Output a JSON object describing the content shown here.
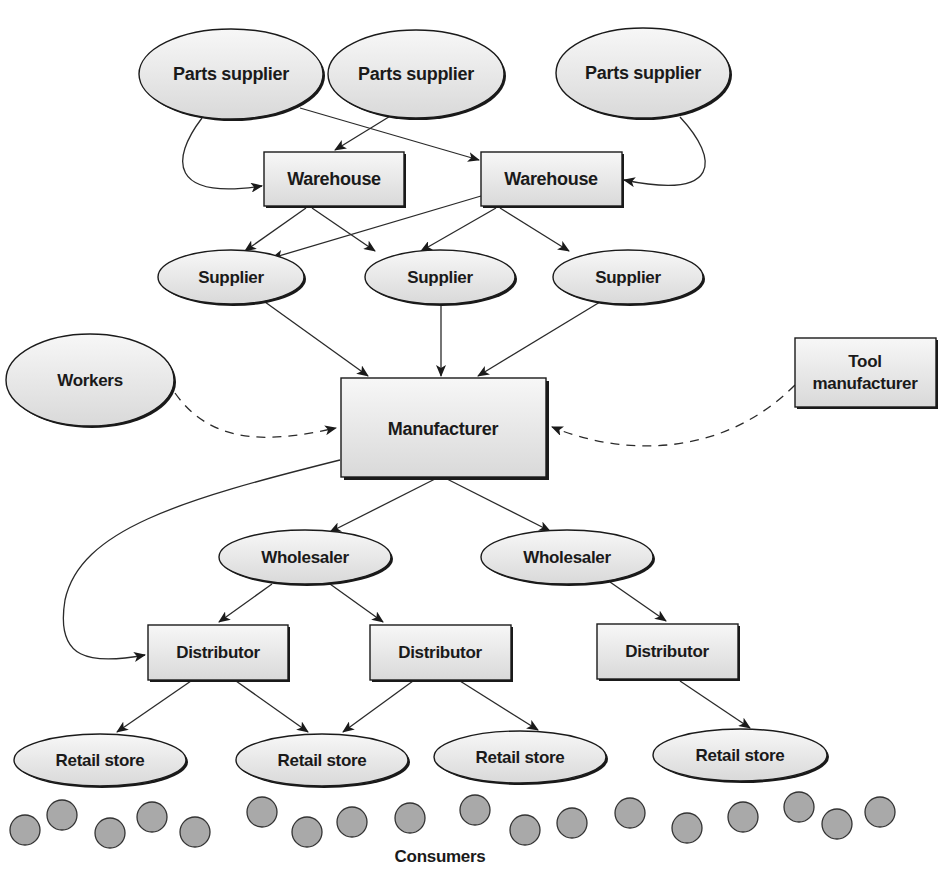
{
  "diagram": {
    "colors": {
      "node_fill_top": "#f7f7f7",
      "node_fill_bottom": "#dcdcdc",
      "stroke": "#1a1a1a",
      "consumer_fill": "#a9a9a9"
    },
    "nodes": {
      "parts_supplier_1": {
        "label": "Parts supplier",
        "shape": "ellipse"
      },
      "parts_supplier_2": {
        "label": "Parts supplier",
        "shape": "ellipse"
      },
      "parts_supplier_3": {
        "label": "Parts supplier",
        "shape": "ellipse"
      },
      "warehouse_1": {
        "label": "Warehouse",
        "shape": "rect"
      },
      "warehouse_2": {
        "label": "Warehouse",
        "shape": "rect"
      },
      "supplier_1": {
        "label": "Supplier",
        "shape": "ellipse"
      },
      "supplier_2": {
        "label": "Supplier",
        "shape": "ellipse"
      },
      "supplier_3": {
        "label": "Supplier",
        "shape": "ellipse"
      },
      "workers": {
        "label": "Workers",
        "shape": "ellipse"
      },
      "manufacturer": {
        "label": "Manufacturer",
        "shape": "rect"
      },
      "tool_manufacturer": {
        "label_line1": "Tool",
        "label_line2": "manufacturer",
        "shape": "rect"
      },
      "wholesaler_1": {
        "label": "Wholesaler",
        "shape": "ellipse"
      },
      "wholesaler_2": {
        "label": "Wholesaler",
        "shape": "ellipse"
      },
      "distributor_1": {
        "label": "Distributor",
        "shape": "rect"
      },
      "distributor_2": {
        "label": "Distributor",
        "shape": "rect"
      },
      "distributor_3": {
        "label": "Distributor",
        "shape": "rect"
      },
      "retail_store_1": {
        "label": "Retail store",
        "shape": "ellipse"
      },
      "retail_store_2": {
        "label": "Retail store",
        "shape": "ellipse"
      },
      "retail_store_3": {
        "label": "Retail store",
        "shape": "ellipse"
      },
      "retail_store_4": {
        "label": "Retail store",
        "shape": "ellipse"
      },
      "consumers": {
        "label": "Consumers",
        "count": 20
      }
    },
    "edges": [
      {
        "from": "parts_supplier_1",
        "to": "warehouse_1",
        "style": "solid"
      },
      {
        "from": "parts_supplier_1",
        "to": "warehouse_2",
        "style": "solid"
      },
      {
        "from": "parts_supplier_2",
        "to": "warehouse_1",
        "style": "solid"
      },
      {
        "from": "parts_supplier_3",
        "to": "warehouse_2",
        "style": "solid"
      },
      {
        "from": "warehouse_1",
        "to": "supplier_1",
        "style": "solid"
      },
      {
        "from": "warehouse_1",
        "to": "supplier_2",
        "style": "solid"
      },
      {
        "from": "warehouse_2",
        "to": "supplier_1",
        "style": "solid"
      },
      {
        "from": "warehouse_2",
        "to": "supplier_2",
        "style": "solid"
      },
      {
        "from": "warehouse_2",
        "to": "supplier_3",
        "style": "solid"
      },
      {
        "from": "supplier_1",
        "to": "manufacturer",
        "style": "solid"
      },
      {
        "from": "supplier_2",
        "to": "manufacturer",
        "style": "solid"
      },
      {
        "from": "supplier_3",
        "to": "manufacturer",
        "style": "solid"
      },
      {
        "from": "workers",
        "to": "manufacturer",
        "style": "dashed"
      },
      {
        "from": "tool_manufacturer",
        "to": "manufacturer",
        "style": "dashed"
      },
      {
        "from": "manufacturer",
        "to": "wholesaler_1",
        "style": "solid"
      },
      {
        "from": "manufacturer",
        "to": "wholesaler_2",
        "style": "solid"
      },
      {
        "from": "manufacturer",
        "to": "distributor_1",
        "style": "solid"
      },
      {
        "from": "wholesaler_1",
        "to": "distributor_1",
        "style": "solid"
      },
      {
        "from": "wholesaler_1",
        "to": "distributor_2",
        "style": "solid"
      },
      {
        "from": "wholesaler_2",
        "to": "distributor_3",
        "style": "solid"
      },
      {
        "from": "distributor_1",
        "to": "retail_store_1",
        "style": "solid"
      },
      {
        "from": "distributor_1",
        "to": "retail_store_2",
        "style": "solid"
      },
      {
        "from": "distributor_2",
        "to": "retail_store_2",
        "style": "solid"
      },
      {
        "from": "distributor_2",
        "to": "retail_store_3",
        "style": "solid"
      },
      {
        "from": "distributor_3",
        "to": "retail_store_4",
        "style": "solid"
      }
    ]
  }
}
